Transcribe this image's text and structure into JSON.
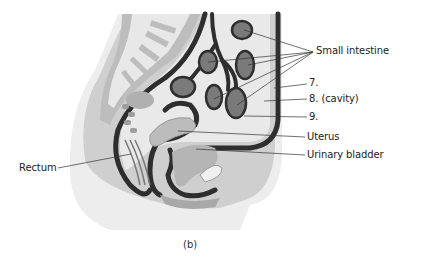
{
  "figure": {
    "caption": "(b)",
    "colors": {
      "background": "#ffffff",
      "skin": "#ebebeb",
      "body_wall": "#c8c8c8",
      "serosa_dark": "#2e2e2e",
      "cavity_light": "#e6e6e6",
      "intestine_loop": "#7a7a7a",
      "label_text": "#222222",
      "leader_line": "#333333"
    }
  },
  "labels": {
    "small_intestine": "Small intestine",
    "seven": "7.",
    "eight": "8. (cavity)",
    "nine": "9.",
    "uterus": "Uterus",
    "urinary_bladder": "Urinary bladder",
    "rectum": "Rectum"
  }
}
